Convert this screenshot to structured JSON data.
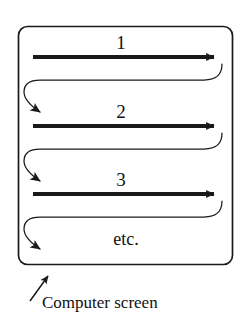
{
  "diagram": {
    "type": "raster-scan-illustration",
    "screen": {
      "shape": "rounded-rectangle",
      "border_color": "#1a1a1a",
      "fill_color": "#ffffff",
      "x": 18,
      "y": 26,
      "width": 215,
      "height": 239,
      "corner_radius": 9
    },
    "scan_lines": [
      {
        "label": "1",
        "label_x": 121,
        "label_y": 42,
        "line_y": 57,
        "start_x": 33,
        "end_x": 222,
        "stroke_color": "#1a1a1a",
        "thickness": 4,
        "arrow_direction": "right"
      },
      {
        "label": "2",
        "label_x": 121,
        "label_y": 111,
        "line_y": 126,
        "start_x": 33,
        "end_x": 222,
        "stroke_color": "#1a1a1a",
        "thickness": 4,
        "arrow_direction": "right"
      },
      {
        "label": "3",
        "label_x": 121,
        "label_y": 179,
        "line_y": 194,
        "start_x": 33,
        "end_x": 222,
        "stroke_color": "#1a1a1a",
        "thickness": 4,
        "arrow_direction": "right"
      }
    ],
    "retrace_lines": [
      {
        "name": "retrace-1",
        "from_y": 57,
        "to_y": 126,
        "hook_right_x": 222,
        "hook_left_x": 26,
        "stroke_color": "#1a1a1a",
        "thickness": 1,
        "arrow_direction": "down-right"
      },
      {
        "name": "retrace-2",
        "from_y": 126,
        "to_y": 194,
        "hook_right_x": 222,
        "hook_left_x": 26,
        "stroke_color": "#1a1a1a",
        "thickness": 1,
        "arrow_direction": "down-right"
      },
      {
        "name": "retrace-3",
        "from_y": 194,
        "to_y": 252,
        "hook_right_x": 222,
        "hook_left_x": 26,
        "stroke_color": "#1a1a1a",
        "thickness": 1,
        "arrow_direction": "down-right"
      }
    ],
    "etc_label": {
      "text": "etc.",
      "x": 126,
      "y": 239
    },
    "caption": {
      "text": "Computer screen",
      "x": 42,
      "y": 302,
      "pointer": {
        "name": "caption-pointer-arrow",
        "from_x": 30,
        "from_y": 300,
        "to_x": 51,
        "to_y": 271,
        "stroke_color": "#1a1a1a",
        "thickness": 1.6
      }
    }
  }
}
